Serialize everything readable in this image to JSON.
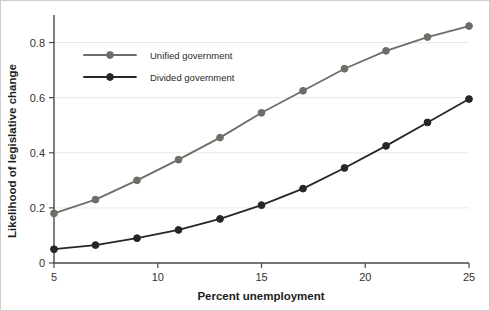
{
  "chart_data": {
    "type": "line",
    "title": "",
    "xlabel": "Percent unemployment",
    "ylabel": "Likelihood of legislative change",
    "x": [
      5,
      7,
      9,
      11,
      13,
      15,
      17,
      19,
      21,
      23,
      25
    ],
    "xlim": [
      5,
      25
    ],
    "ylim": [
      0,
      0.9
    ],
    "xticks": [
      5,
      10,
      15,
      20,
      25
    ],
    "xtick_labels": [
      "5",
      "10",
      "15",
      "20",
      "25"
    ],
    "yticks": [
      0,
      0.2,
      0.4,
      0.6,
      0.8
    ],
    "ytick_labels": [
      "0",
      "0.2",
      "0.4",
      "0.6",
      "0.8"
    ],
    "grid": "horizontal",
    "legend_position": "upper-left-inside",
    "series": [
      {
        "name": "Unified government",
        "color": "#6e6e68",
        "marker": "circle",
        "values": [
          0.18,
          0.23,
          0.3,
          0.375,
          0.455,
          0.545,
          0.625,
          0.705,
          0.77,
          0.82,
          0.86
        ]
      },
      {
        "name": "Divided government",
        "color": "#26262a",
        "marker": "circle",
        "values": [
          0.05,
          0.065,
          0.09,
          0.12,
          0.16,
          0.21,
          0.27,
          0.345,
          0.425,
          0.51,
          0.595
        ]
      }
    ]
  },
  "legend": {
    "entries": [
      {
        "label": "Unified government",
        "color": "#6e6e68"
      },
      {
        "label": "Divided government",
        "color": "#26262a"
      }
    ]
  },
  "style": {
    "axis_color": "#4a4a45",
    "grid_color": "#e9e9e4",
    "background": "#ffffff",
    "border_color": "#cfcfc9",
    "text_color": "#1d1d1b"
  }
}
